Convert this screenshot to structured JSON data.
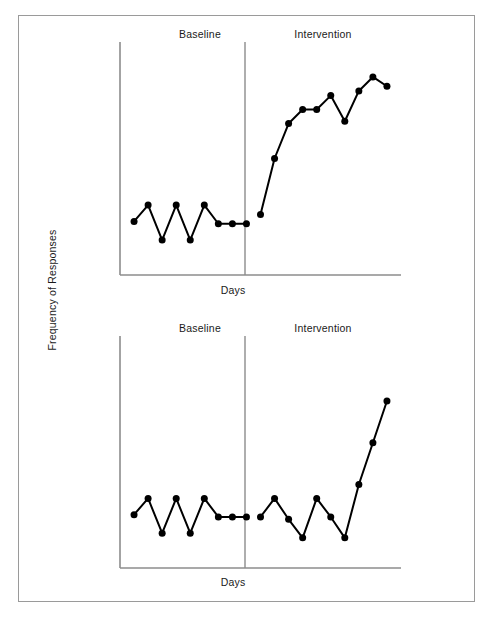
{
  "figure": {
    "y_axis_label": "Frequency of Responses",
    "border_color": "#9a9a9a",
    "line_color": "#000000",
    "marker_color": "#000000"
  },
  "chart_data": [
    {
      "type": "line",
      "title": "",
      "xlabel": "Days",
      "ylabel": "Frequency of Responses",
      "grid": false,
      "legend": "none",
      "xlim": [
        0,
        20
      ],
      "ylim": [
        0,
        10
      ],
      "phases": [
        {
          "label": "Baseline",
          "x_start": 0,
          "x_end": 9
        },
        {
          "label": "Intervention",
          "x_start": 9,
          "x_end": 20
        }
      ],
      "series": [
        {
          "name": "Baseline",
          "phase": "Baseline",
          "x": [
            1,
            2,
            3,
            4,
            5,
            6,
            7,
            8,
            9
          ],
          "values": [
            2.3,
            3.0,
            1.5,
            3.0,
            1.5,
            3.0,
            2.2,
            2.2,
            2.2
          ]
        },
        {
          "name": "Intervention",
          "phase": "Intervention",
          "x": [
            10,
            11,
            12,
            13,
            14,
            15,
            16,
            17,
            18,
            19
          ],
          "values": [
            2.6,
            5.0,
            6.5,
            7.1,
            7.1,
            7.7,
            6.6,
            7.9,
            8.5,
            8.1
          ]
        }
      ]
    },
    {
      "type": "line",
      "title": "",
      "xlabel": "Days",
      "ylabel": "Frequency of Responses",
      "grid": false,
      "legend": "none",
      "xlim": [
        0,
        20
      ],
      "ylim": [
        0,
        10
      ],
      "phases": [
        {
          "label": "Baseline",
          "x_start": 0,
          "x_end": 9
        },
        {
          "label": "Intervention",
          "x_start": 9,
          "x_end": 20
        }
      ],
      "series": [
        {
          "name": "Baseline",
          "phase": "Baseline",
          "x": [
            1,
            2,
            3,
            4,
            5,
            6,
            7,
            8,
            9
          ],
          "values": [
            2.3,
            3.0,
            1.5,
            3.0,
            1.5,
            3.0,
            2.2,
            2.2,
            2.2
          ]
        },
        {
          "name": "Intervention",
          "phase": "Intervention",
          "x": [
            10,
            11,
            12,
            13,
            14,
            15,
            16,
            17,
            18,
            19
          ],
          "values": [
            2.2,
            3.0,
            2.1,
            1.3,
            3.0,
            2.2,
            1.3,
            3.6,
            5.4,
            7.2
          ]
        }
      ]
    }
  ],
  "panels": [
    {
      "id": "top",
      "baseline_label": "Baseline",
      "intervention_label": "Intervention",
      "x_axis_label": "Days"
    },
    {
      "id": "bottom",
      "baseline_label": "Baseline",
      "intervention_label": "Intervention",
      "x_axis_label": "Days"
    }
  ]
}
